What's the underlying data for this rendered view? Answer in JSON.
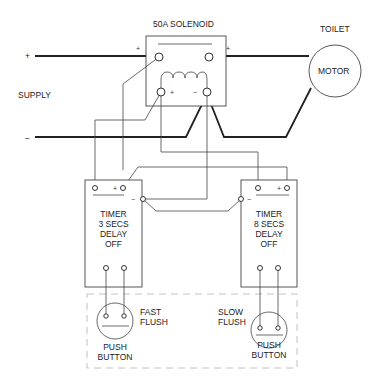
{
  "supply": {
    "label": "SUPPLY",
    "positive_label": "+",
    "negative_label": "−"
  },
  "solenoid": {
    "title": "50A SOLENOID",
    "plus_in": "+",
    "plus_out": "+",
    "coil_plus": "+",
    "coil_minus": "−"
  },
  "motor": {
    "caption": "TOILET",
    "label": "MOTOR"
  },
  "timer_left": {
    "line1": "TIMER",
    "line2": "3 SECS",
    "line3": "DELAY",
    "line4": "OFF",
    "plus": "+",
    "minus": "−"
  },
  "timer_right": {
    "line1": "TIMER",
    "line2": "8 SECS",
    "line3": "DELAY",
    "line4": "OFF",
    "plus": "+",
    "minus": "−"
  },
  "button_fast": {
    "label1": "FAST",
    "label2": "FLUSH",
    "caption1": "PUSH",
    "caption2": "BUTTON"
  },
  "button_slow": {
    "label1": "SLOW",
    "label2": "FLUSH",
    "caption1": "PUSH",
    "caption2": "BUTTON"
  }
}
